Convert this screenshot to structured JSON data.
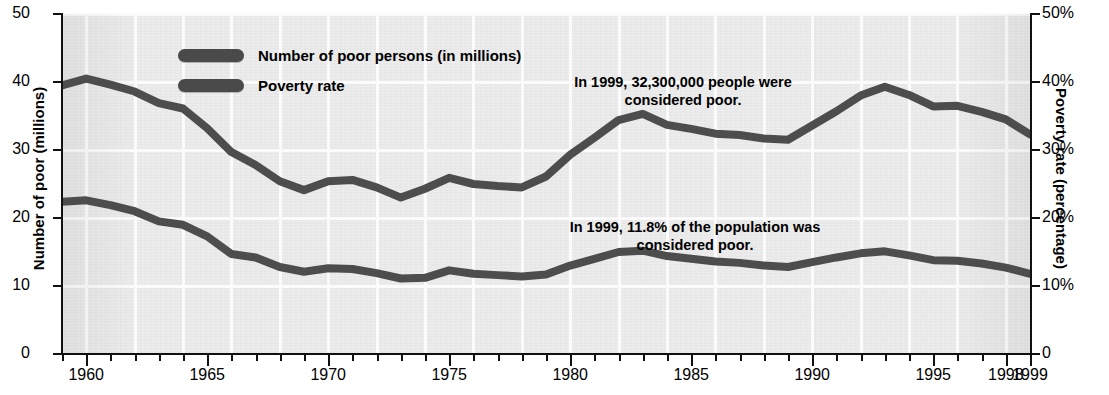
{
  "chart_data": {
    "type": "line",
    "title": "",
    "xlabel": "",
    "ylabel": "Number of poor (millions)",
    "ylabel_right": "Poverty rate (percentage)",
    "xlim": [
      1959,
      1999
    ],
    "ylim": [
      0,
      50
    ],
    "ylim_right": [
      0,
      50
    ],
    "grid": true,
    "legend_position": "upper-left-inside",
    "x_tick_labels": [
      "1960",
      "1965",
      "1970",
      "1975",
      "1980",
      "1985",
      "1990",
      "1995",
      "1998",
      "1999"
    ],
    "x_tick_values": [
      1960,
      1965,
      1970,
      1975,
      1980,
      1985,
      1990,
      1995,
      1998,
      1999
    ],
    "y_tick_labels_left": [
      "50",
      "40",
      "30",
      "20",
      "10",
      "0"
    ],
    "y_tick_values_left": [
      50,
      40,
      30,
      20,
      10,
      0
    ],
    "y_tick_labels_right": [
      "50%",
      "40%",
      "30%",
      "20%",
      "10%",
      "0"
    ],
    "y_tick_values_right": [
      50,
      40,
      30,
      20,
      10,
      0
    ],
    "x": [
      1959,
      1960,
      1961,
      1962,
      1963,
      1964,
      1965,
      1966,
      1967,
      1968,
      1969,
      1970,
      1971,
      1972,
      1973,
      1974,
      1975,
      1976,
      1977,
      1978,
      1979,
      1980,
      1981,
      1982,
      1983,
      1984,
      1985,
      1986,
      1987,
      1988,
      1989,
      1990,
      1991,
      1992,
      1993,
      1994,
      1995,
      1996,
      1997,
      1998,
      1999
    ],
    "series": [
      {
        "name": "Number of poor persons (in millions)",
        "axis": "left",
        "units": "millions",
        "color": "#4d4d4d",
        "values": [
          39.5,
          40.5,
          39.6,
          38.6,
          36.9,
          36.1,
          33.2,
          29.7,
          27.8,
          25.4,
          24.1,
          25.4,
          25.6,
          24.5,
          23.0,
          24.3,
          25.9,
          25.0,
          24.7,
          24.5,
          26.1,
          29.3,
          31.8,
          34.4,
          35.3,
          33.7,
          33.1,
          32.4,
          32.2,
          31.7,
          31.5,
          33.6,
          35.7,
          38.0,
          39.3,
          38.1,
          36.4,
          36.5,
          35.6,
          34.5,
          32.3
        ]
      },
      {
        "name": "Poverty rate",
        "axis": "right",
        "units": "percent",
        "color": "#4d4d4d",
        "values": [
          22.4,
          22.6,
          21.9,
          21.0,
          19.5,
          19.0,
          17.3,
          14.7,
          14.2,
          12.8,
          12.1,
          12.6,
          12.5,
          11.9,
          11.1,
          11.2,
          12.3,
          11.8,
          11.6,
          11.4,
          11.7,
          13.0,
          14.0,
          15.0,
          15.2,
          14.4,
          14.0,
          13.6,
          13.4,
          13.0,
          12.8,
          13.5,
          14.2,
          14.8,
          15.1,
          14.5,
          13.8,
          13.7,
          13.3,
          12.7,
          11.8
        ]
      }
    ],
    "annotations": [
      {
        "id": "count",
        "text": "In 1999, 32,300,000 people were\nconsidered poor."
      },
      {
        "id": "rate",
        "text": "In 1999, 11.8% of the population was\nconsidered poor."
      }
    ]
  },
  "legend": {
    "items": [
      {
        "label": "Number of poor persons (in millions)"
      },
      {
        "label": "Poverty rate"
      }
    ]
  }
}
